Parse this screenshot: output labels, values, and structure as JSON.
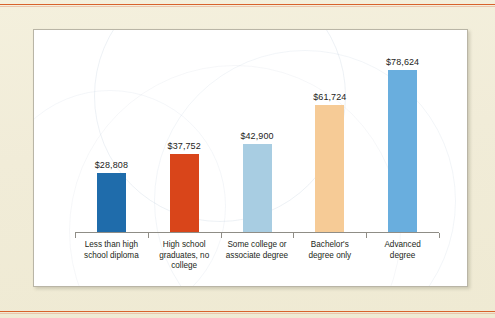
{
  "chart_data": {
    "type": "bar",
    "title": "",
    "xlabel": "",
    "ylabel": "",
    "ylim": [
      0,
      85000
    ],
    "grid": false,
    "legend": "none",
    "categories": [
      "Less than high school diploma",
      "High school graduates, no college",
      "Some college or associate degree",
      "Bachelor's degree only",
      "Advanced degree"
    ],
    "values": [
      28808,
      37752,
      42900,
      61724,
      78624
    ],
    "value_labels": [
      "$28,808",
      "$37,752",
      "$42,900",
      "$61,724",
      "$78,624"
    ],
    "bar_colors": [
      "#1f6cab",
      "#d9451a",
      "#a8cde2",
      "#f6cb96",
      "#69aede"
    ]
  },
  "bars": [
    {
      "label_line1": "Less than high",
      "label_line2": "school diploma",
      "label_line3": "",
      "value_label": "$28,808",
      "color": "#1f6cab"
    },
    {
      "label_line1": "High school",
      "label_line2": "graduates, no",
      "label_line3": "college",
      "value_label": "$37,752",
      "color": "#d9451a"
    },
    {
      "label_line1": "Some college or",
      "label_line2": "associate degree",
      "label_line3": "",
      "value_label": "$42,900",
      "color": "#a8cde2"
    },
    {
      "label_line1": "Bachelor's",
      "label_line2": "degree only",
      "label_line3": "",
      "value_label": "$61,724",
      "color": "#f6cb96"
    },
    {
      "label_line1": "Advanced",
      "label_line2": "degree",
      "label_line3": "",
      "value_label": "$78,624",
      "color": "#69aede"
    }
  ],
  "page": {
    "background_color": "#f1ecd8",
    "panel_color": "#ffffff",
    "rule_color": "#d8622c",
    "axis_color": "#8f8d86",
    "text_color": "#231f20"
  }
}
